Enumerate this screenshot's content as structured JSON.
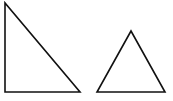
{
  "diagram": {
    "background": "#ffffff",
    "stroke_color": "#111111",
    "stroke_width": 1.6,
    "shapes": [
      {
        "name": "right-triangle",
        "type": "triangle",
        "points": "5,3 5,92 80,92"
      },
      {
        "name": "equilateral-triangle",
        "type": "triangle",
        "points": "131,31 97,92 165,92"
      }
    ]
  }
}
